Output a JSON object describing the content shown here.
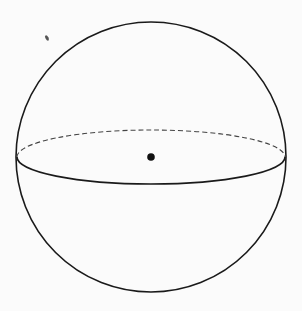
{
  "diagram": {
    "type": "sphere",
    "colors": {
      "background": "#fbfbfb",
      "stroke": "#1a1a1a",
      "dashed_stroke": "#444444",
      "center_dot": "#111111"
    },
    "sphere": {
      "cx": 151,
      "cy": 157,
      "r": 135
    },
    "equator": {
      "cx": 151,
      "cy": 157,
      "rx": 134,
      "ry": 27
    },
    "center_point": {
      "cx": 151,
      "cy": 157,
      "r": 4
    },
    "speck": {
      "cx": 47,
      "cy": 38
    }
  }
}
